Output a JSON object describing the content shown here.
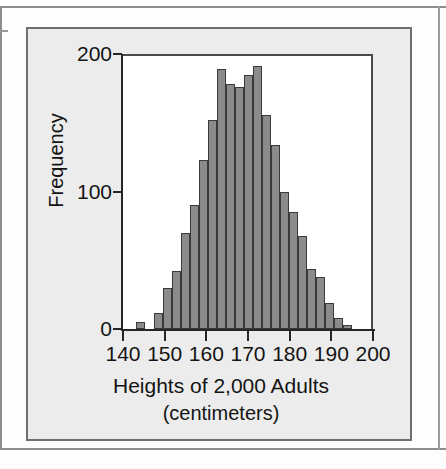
{
  "figure": {
    "frame_color": "#6f6f6f",
    "panel_background": "#ececec",
    "plot_background": "#ffffff"
  },
  "chart_data": {
    "type": "bar",
    "title": "",
    "xlabel": "Heights of 2,000 Adults",
    "xlabel_units": "(centimeters)",
    "ylabel": "Frequency",
    "xlim": [
      140,
      200
    ],
    "ylim": [
      0,
      200
    ],
    "grid": false,
    "legend": null,
    "bar_color": "#8b8b8b",
    "bar_edge_color": "#3a3a3a",
    "bin_width": 2.5,
    "x_ticks": [
      140,
      150,
      160,
      170,
      180,
      190,
      200
    ],
    "x_tick_labels": [
      "140",
      "150",
      "160",
      "170",
      "180",
      "190",
      "200"
    ],
    "y_ticks": [
      0,
      100,
      200
    ],
    "y_tick_labels": [
      "0",
      "100",
      "200"
    ],
    "bins": [
      {
        "x0": 147.5,
        "x1": 150.0,
        "value": 5
      },
      {
        "x0": 150.0,
        "x1": 152.5,
        "value": 0
      },
      {
        "x0": 152.5,
        "x1": 155.0,
        "value": 12
      },
      {
        "x0": 155.0,
        "x1": 157.5,
        "value": 30
      },
      {
        "x0": 157.5,
        "x1": 160.0,
        "value": 42
      },
      {
        "x0": 160.0,
        "x1": 162.5,
        "value": 70
      },
      {
        "x0": 162.5,
        "x1": 165.0,
        "value": 90
      },
      {
        "x0": 165.0,
        "x1": 167.5,
        "value": 123
      },
      {
        "x0": 167.5,
        "x1": 170.0,
        "value": 152
      },
      {
        "x0": 170.0,
        "x1": 172.5,
        "value": 189
      },
      {
        "x0": 172.5,
        "x1": 175.0,
        "value": 178
      },
      {
        "x0": 175.0,
        "x1": 177.5,
        "value": 176
      },
      {
        "x0": 177.5,
        "x1": 180.0,
        "value": 185
      },
      {
        "x0": 180.0,
        "x1": 182.5,
        "value": 191
      },
      {
        "x0": 182.5,
        "x1": 185.0,
        "value": 156
      },
      {
        "x0": 185.0,
        "x1": 187.5,
        "value": 134
      },
      {
        "x0": 187.5,
        "x1": 190.0,
        "value": 100
      },
      {
        "x0": 190.0,
        "x1": 192.5,
        "value": 85
      },
      {
        "x0": 192.5,
        "x1": 195.0,
        "value": 68
      },
      {
        "x0": 195.0,
        "x1": 197.5,
        "value": 44
      },
      {
        "x0": 197.5,
        "x1": 200.0,
        "value": 38
      },
      {
        "x0": 200.0,
        "x1": 202.5,
        "value": 19
      },
      {
        "x0": 202.5,
        "x1": 205.0,
        "value": 8
      },
      {
        "x0": 205.0,
        "x1": 207.5,
        "value": 3
      }
    ],
    "bar_pixels": [
      {
        "left": 13,
        "width": 9,
        "value": 5
      },
      {
        "left": 31,
        "width": 9,
        "value": 12
      },
      {
        "left": 40,
        "width": 9,
        "value": 30
      },
      {
        "left": 49,
        "width": 9,
        "value": 42
      },
      {
        "left": 58,
        "width": 9,
        "value": 70
      },
      {
        "left": 67,
        "width": 9,
        "value": 90
      },
      {
        "left": 76,
        "width": 9,
        "value": 123
      },
      {
        "left": 85,
        "width": 9,
        "value": 152
      },
      {
        "left": 94,
        "width": 9,
        "value": 189
      },
      {
        "left": 103,
        "width": 9,
        "value": 178
      },
      {
        "left": 112,
        "width": 9,
        "value": 176
      },
      {
        "left": 121,
        "width": 9,
        "value": 185
      },
      {
        "left": 130,
        "width": 9,
        "value": 191
      },
      {
        "left": 139,
        "width": 9,
        "value": 156
      },
      {
        "left": 148,
        "width": 9,
        "value": 134
      },
      {
        "left": 157,
        "width": 9,
        "value": 100
      },
      {
        "left": 166,
        "width": 9,
        "value": 85
      },
      {
        "left": 175,
        "width": 9,
        "value": 68
      },
      {
        "left": 184,
        "width": 9,
        "value": 44
      },
      {
        "left": 193,
        "width": 9,
        "value": 38
      },
      {
        "left": 202,
        "width": 9,
        "value": 19
      },
      {
        "left": 211,
        "width": 9,
        "value": 8
      },
      {
        "left": 220,
        "width": 9,
        "value": 3
      }
    ]
  }
}
